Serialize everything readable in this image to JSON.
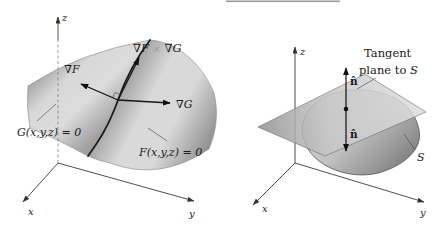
{
  "figure": {
    "background": "#ffffff",
    "top_rule_color": "#999999"
  },
  "colors": {
    "ink": "#1a1a1a",
    "axis": "#3a3a3a",
    "cross_symbol": "#9a9a9a",
    "surface_light": "#d8d8d8",
    "surface_dark": "#8f8f8f"
  },
  "left_diagram": {
    "z_label": "z",
    "x_label": "x",
    "y_label": "y",
    "grad_f": "∇F",
    "grad_g": "∇G",
    "cross_product": {
      "part1": "∇F",
      "times": "×",
      "part2": "∇G"
    },
    "surface_g": "G(x,y,z) = 0",
    "surface_f": "F(x,y,z) = 0"
  },
  "right_diagram": {
    "z_label": "z",
    "x_label": "x",
    "y_label": "y",
    "normal_upper": "n̂",
    "normal_lower": "n̂",
    "tangent_line1": "Tangent",
    "tangent_line2_prefix": "plane to ",
    "tangent_line2_s": "S",
    "surface_label": "S"
  }
}
